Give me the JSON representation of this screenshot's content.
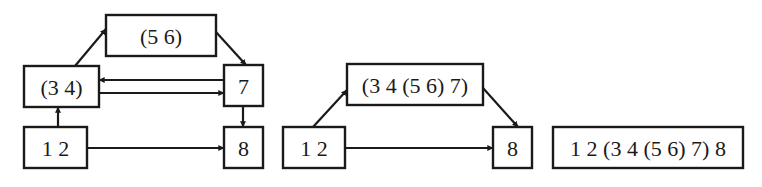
{
  "diagram": {
    "colors": {
      "stroke": "#1a1a1a",
      "background": "#ffffff"
    },
    "panels": [
      {
        "id": "panel-1",
        "nodes": [
          {
            "id": "n56",
            "label": "(5 6)",
            "x": 106,
            "y": 15,
            "w": 110,
            "h": 41
          },
          {
            "id": "n34",
            "label": "(3 4)",
            "x": 24,
            "y": 66,
            "w": 75,
            "h": 41
          },
          {
            "id": "n7",
            "label": "7",
            "x": 224,
            "y": 65,
            "w": 39,
            "h": 41
          },
          {
            "id": "n12",
            "label": "1 2",
            "x": 24,
            "y": 127,
            "w": 63,
            "h": 41
          },
          {
            "id": "n8",
            "label": "8",
            "x": 224,
            "y": 127,
            "w": 39,
            "h": 41
          }
        ],
        "edges": [
          {
            "from": "n34",
            "to": "n56",
            "x1": 75,
            "y1": 66,
            "x2": 106,
            "y2": 29
          },
          {
            "from": "n56",
            "to": "n7",
            "x1": 216,
            "y1": 32,
            "x2": 246,
            "y2": 65
          },
          {
            "from": "n7",
            "to": "n34",
            "x1": 224,
            "y1": 80,
            "x2": 99,
            "y2": 80
          },
          {
            "from": "n34",
            "to": "n7",
            "x1": 99,
            "y1": 93,
            "x2": 224,
            "y2": 93
          },
          {
            "from": "n7",
            "to": "n8",
            "x1": 243,
            "y1": 106,
            "x2": 243,
            "y2": 127
          },
          {
            "from": "n12",
            "to": "n34",
            "x1": 58,
            "y1": 127,
            "x2": 58,
            "y2": 107
          },
          {
            "from": "n12",
            "to": "n8",
            "x1": 87,
            "y1": 148,
            "x2": 224,
            "y2": 148
          }
        ]
      },
      {
        "id": "panel-2",
        "nodes": [
          {
            "id": "m3457",
            "label": "(3 4 (5 6) 7)",
            "x": 347,
            "y": 64,
            "w": 136,
            "h": 41
          },
          {
            "id": "m12",
            "label": "1 2",
            "x": 283,
            "y": 127,
            "w": 62,
            "h": 41
          },
          {
            "id": "m8",
            "label": "8",
            "x": 493,
            "y": 127,
            "w": 39,
            "h": 41
          }
        ],
        "edges": [
          {
            "from": "m12",
            "to": "m3457",
            "x1": 313,
            "y1": 127,
            "x2": 347,
            "y2": 90
          },
          {
            "from": "m3457",
            "to": "m8",
            "x1": 483,
            "y1": 88,
            "x2": 518,
            "y2": 127
          },
          {
            "from": "m12",
            "to": "m8",
            "x1": 345,
            "y1": 148,
            "x2": 493,
            "y2": 148
          }
        ]
      },
      {
        "id": "panel-3",
        "nodes": [
          {
            "id": "r",
            "label": "1 2 (3 4 (5 6) 7) 8",
            "x": 553,
            "y": 127,
            "w": 190,
            "h": 41
          }
        ],
        "edges": []
      }
    ]
  }
}
